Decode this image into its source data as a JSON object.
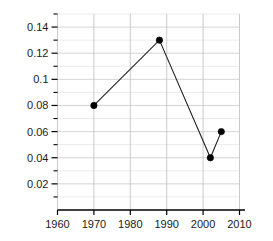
{
  "chart_data": {
    "type": "line",
    "title": "",
    "subtitle": "",
    "xlabel": "",
    "ylabel": "",
    "xlim": [
      1960,
      2010
    ],
    "ylim": [
      0,
      0.15
    ],
    "grid": true,
    "legend": false,
    "legend_position": "none",
    "x_ticks": [
      1960,
      1970,
      1980,
      1990,
      2000,
      2010
    ],
    "x_tick_labels": [
      "1960",
      "1970",
      "1980",
      "1990",
      "2000",
      "2010"
    ],
    "y_ticks": [
      0.02,
      0.04,
      0.06,
      0.08,
      0.1,
      0.12,
      0.14
    ],
    "y_tick_labels": [
      "0.02",
      "0.04",
      "0.06",
      "0.08",
      "0.1",
      "0.12",
      "0.14"
    ],
    "y_minor_ticks": [
      0.01,
      0.03,
      0.05,
      0.07,
      0.09,
      0.11,
      0.13,
      0.15
    ],
    "x": [
      1970,
      1988,
      2002,
      2005
    ],
    "values": [
      0.08,
      0.13,
      0.04,
      0.06
    ],
    "series": [
      {
        "name": "series-1",
        "color": "#000000",
        "marker": "circle",
        "points": [
          {
            "x": 1970,
            "y": 0.08
          },
          {
            "x": 1988,
            "y": 0.13
          },
          {
            "x": 2002,
            "y": 0.04
          },
          {
            "x": 2005,
            "y": 0.06
          }
        ]
      }
    ],
    "colors": {
      "line": "#222222",
      "marker": "#000000",
      "grid_major": "#c9c9c9",
      "grid_minor": "#e2e2e2",
      "grid_vertical": "#bdbdbd",
      "axis": "#000000",
      "background": "#ffffff",
      "tick_text": "#1a1a1a"
    }
  }
}
